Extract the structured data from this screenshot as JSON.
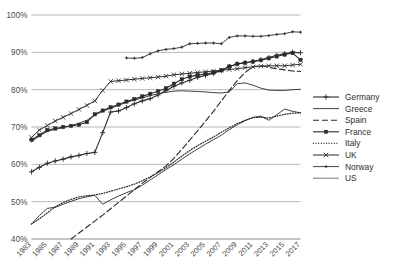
{
  "chart_data": {
    "type": "line",
    "title": "",
    "subtitle": "",
    "xlabel": "",
    "ylabel": "",
    "xlim": [
      1983,
      2017
    ],
    "ylim": [
      40,
      100
    ],
    "grid": true,
    "y_ticks": [
      40,
      50,
      60,
      70,
      80,
      90,
      100
    ],
    "y_tick_labels": [
      "40%",
      "50%",
      "60%",
      "70%",
      "80%",
      "90%",
      "100%"
    ],
    "x": [
      1983,
      1984,
      1985,
      1986,
      1987,
      1988,
      1989,
      1990,
      1991,
      1992,
      1993,
      1994,
      1995,
      1996,
      1997,
      1998,
      1999,
      2000,
      2001,
      2002,
      2003,
      2004,
      2005,
      2006,
      2007,
      2008,
      2009,
      2010,
      2011,
      2012,
      2013,
      2014,
      2015,
      2016,
      2017
    ],
    "x_tick_labels": [
      "1983",
      "1985",
      "1987",
      "1989",
      "1991",
      "1993",
      "1995",
      "1997",
      "1999",
      "2001",
      "2003",
      "2005",
      "2007",
      "2009",
      "2011",
      "2013",
      "2015",
      "2017"
    ],
    "legend_position": "right",
    "series": [
      {
        "name": "Germany",
        "marker": "plus",
        "dash": "none",
        "color": "#2b2b2b",
        "width": 1.1,
        "x": [
          1983,
          1984,
          1985,
          1986,
          1987,
          1988,
          1989,
          1990,
          1991,
          1992,
          1993,
          1994,
          1995,
          1996,
          1997,
          1998,
          1999,
          2000,
          2001,
          2002,
          2003,
          2004,
          2005,
          2006,
          2007,
          2008,
          2009,
          2010,
          2011,
          2012,
          2013,
          2014,
          2015,
          2016,
          2017
        ],
        "values": [
          58.0,
          59.2,
          60.3,
          60.9,
          61.4,
          62.0,
          62.4,
          62.9,
          63.2,
          68.5,
          74.0,
          74.3,
          75.2,
          76.2,
          77.0,
          77.6,
          78.6,
          79.8,
          80.9,
          81.8,
          82.5,
          83.3,
          83.8,
          84.4,
          85.1,
          86.2,
          86.9,
          87.2,
          87.6,
          88.0,
          88.6,
          89.2,
          89.6,
          90.0,
          89.9
        ]
      },
      {
        "name": "Greece",
        "marker": "none",
        "dash": "none",
        "color": "#2b2b2b",
        "width": 0.9,
        "x": [
          1983,
          1984,
          1985,
          1986,
          1987,
          1988,
          1989,
          1990,
          1991,
          1992,
          1993,
          1994,
          1995,
          1996,
          1997,
          1998,
          1999,
          2000,
          2001,
          2002,
          2003,
          2004,
          2005,
          2006,
          2007,
          2008,
          2009,
          2010,
          2011,
          2012,
          2013,
          2014,
          2015,
          2016,
          2017
        ],
        "values": [
          44.0,
          46.3,
          48.2,
          48.5,
          49.3,
          50.1,
          50.8,
          51.3,
          51.7,
          49.3,
          50.5,
          51.5,
          52.4,
          53.2,
          54.4,
          55.8,
          57.2,
          58.6,
          59.9,
          61.4,
          62.8,
          64.1,
          65.4,
          66.6,
          67.8,
          69.3,
          70.6,
          71.7,
          72.6,
          72.9,
          71.8,
          73.3,
          74.8,
          74.2,
          73.8
        ]
      },
      {
        "name": "Spain",
        "marker": "none",
        "dash": "dashed",
        "color": "#2b2b2b",
        "width": 1.1,
        "x": [
          1988,
          1989,
          1990,
          1991,
          1992,
          1993,
          1994,
          1995,
          1996,
          1997,
          1998,
          1999,
          2000,
          2001,
          2002,
          2003,
          2004,
          2005,
          2006,
          2007,
          2008,
          2009,
          2010,
          2011,
          2012,
          2013,
          2014,
          2015,
          2016,
          2017
        ],
        "values": [
          40.0,
          41.6,
          43.2,
          44.8,
          46.4,
          48.1,
          49.8,
          51.5,
          53.2,
          54.9,
          56.5,
          58.0,
          59.6,
          61.6,
          64.0,
          66.5,
          69.0,
          71.6,
          74.2,
          77.0,
          79.8,
          82.4,
          84.6,
          86.2,
          86.4,
          86.0,
          85.6,
          85.3,
          85.0,
          84.9
        ]
      },
      {
        "name": "France",
        "marker": "square",
        "dash": "none",
        "color": "#2b2b2b",
        "width": 1.1,
        "x": [
          1983,
          1984,
          1985,
          1986,
          1987,
          1988,
          1989,
          1990,
          1991,
          1992,
          1993,
          1994,
          1995,
          1996,
          1997,
          1998,
          1999,
          2000,
          2001,
          2002,
          2003,
          2004,
          2005,
          2006,
          2007,
          2008,
          2009,
          2010,
          2011,
          2012,
          2013,
          2014,
          2015,
          2016,
          2017
        ],
        "values": [
          66.6,
          67.8,
          69.2,
          69.6,
          70.0,
          70.3,
          70.6,
          71.3,
          73.4,
          74.4,
          75.3,
          76.0,
          76.8,
          77.5,
          78.2,
          78.9,
          79.6,
          80.4,
          81.6,
          82.8,
          83.5,
          83.9,
          84.2,
          84.6,
          85.2,
          86.2,
          86.9,
          87.2,
          87.5,
          87.9,
          88.4,
          88.9,
          89.4,
          89.8,
          88.0
        ]
      },
      {
        "name": "Italy",
        "marker": "none",
        "dash": "dotted",
        "color": "#2b2b2b",
        "width": 1.2,
        "x": [
          1983,
          1984,
          1985,
          1986,
          1987,
          1988,
          1989,
          1990,
          1991,
          1992,
          1993,
          1994,
          1995,
          1996,
          1997,
          1998,
          1999,
          2000,
          2001,
          2002,
          2003,
          2004,
          2005,
          2006,
          2007,
          2008,
          2009,
          2010,
          2011,
          2012,
          2013,
          2014,
          2015,
          2016,
          2017
        ],
        "values": [
          44.0,
          45.4,
          47.0,
          48.6,
          49.8,
          50.6,
          51.3,
          51.6,
          51.8,
          52.2,
          52.8,
          53.4,
          54.0,
          54.7,
          55.6,
          56.6,
          57.8,
          59.1,
          60.6,
          62.2,
          63.7,
          65.0,
          66.2,
          67.3,
          68.6,
          69.8,
          70.9,
          71.8,
          72.5,
          72.6,
          72.4,
          72.9,
          73.4,
          73.7,
          73.8
        ]
      },
      {
        "name": "UK",
        "marker": "x",
        "dash": "none",
        "color": "#2b2b2b",
        "width": 1.0,
        "x": [
          1983,
          1984,
          1985,
          1986,
          1987,
          1988,
          1989,
          1990,
          1991,
          1992,
          1993,
          1994,
          1995,
          1996,
          1997,
          1998,
          1999,
          2000,
          2001,
          2002,
          2003,
          2004,
          2005,
          2006,
          2007,
          2008,
          2009,
          2010,
          2011,
          2012,
          2013,
          2014,
          2015,
          2016,
          2017
        ],
        "values": [
          67.2,
          69.2,
          70.4,
          71.6,
          72.6,
          73.6,
          74.7,
          75.8,
          77.0,
          79.8,
          82.2,
          82.4,
          82.6,
          82.8,
          83.0,
          83.2,
          83.4,
          83.6,
          84.0,
          84.2,
          84.4,
          84.6,
          84.8,
          85.0,
          85.2,
          85.4,
          85.6,
          85.9,
          86.1,
          86.3,
          86.4,
          86.4,
          86.4,
          86.6,
          86.8
        ]
      },
      {
        "name": "Norway",
        "marker": "dot-plus",
        "dash": "none",
        "color": "#2b2b2b",
        "width": 0.9,
        "x": [
          1995,
          1996,
          1997,
          1998,
          1999,
          2000,
          2001,
          2002,
          2003,
          2004,
          2005,
          2006,
          2007,
          2008,
          2009,
          2010,
          2011,
          2012,
          2013,
          2014,
          2015,
          2016,
          2017
        ],
        "values": [
          88.5,
          88.4,
          88.6,
          89.6,
          90.4,
          90.8,
          91.0,
          91.4,
          92.3,
          92.4,
          92.5,
          92.5,
          92.3,
          94.0,
          94.4,
          94.4,
          94.3,
          94.3,
          94.5,
          94.8,
          95.0,
          95.5,
          95.4
        ]
      },
      {
        "name": "US",
        "marker": "none",
        "dash": "none",
        "color": "#6b6b6b",
        "width": 0.9,
        "x": [
          1983,
          1984,
          1985,
          1986,
          1987,
          1988,
          1989,
          1990,
          1991,
          1992,
          1993,
          1994,
          1995,
          1996,
          1997,
          1998,
          1999,
          2000,
          2001,
          2002,
          2003,
          2004,
          2005,
          2006,
          2007,
          2008,
          2009,
          2010,
          2011,
          2012,
          2013,
          2014,
          2015,
          2016,
          2017
        ],
        "values": [
          66.0,
          67.6,
          68.8,
          69.4,
          69.8,
          70.4,
          71.0,
          71.8,
          73.2,
          74.2,
          75.0,
          75.8,
          76.6,
          77.2,
          77.8,
          78.4,
          78.9,
          79.3,
          79.6,
          79.7,
          79.6,
          79.5,
          79.4,
          79.2,
          79.1,
          79.4,
          81.6,
          81.8,
          81.2,
          80.4,
          79.9,
          79.8,
          79.8,
          80.0,
          80.1
        ]
      }
    ]
  },
  "legend": {
    "items": [
      {
        "label": "Germany"
      },
      {
        "label": "Greece"
      },
      {
        "label": "Spain"
      },
      {
        "label": "France"
      },
      {
        "label": "Italy"
      },
      {
        "label": "UK"
      },
      {
        "label": "Norway"
      },
      {
        "label": "US"
      }
    ]
  }
}
